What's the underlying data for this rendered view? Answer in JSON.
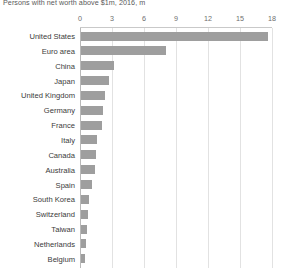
{
  "chart": {
    "subtitle": "Persons with net worth above $1m, 2016, m"
  },
  "chart_data": {
    "type": "bar",
    "orientation": "horizontal",
    "title": "",
    "subtitle": "Persons with net worth above $1m, 2016, m",
    "xlabel": "",
    "ylabel": "",
    "xlim": [
      0,
      18
    ],
    "ticks": [
      "0",
      "3",
      "6",
      "9",
      "12",
      "15",
      "18"
    ],
    "tick_values": [
      0,
      3,
      6,
      9,
      12,
      15,
      18
    ],
    "grid": true,
    "legend": false,
    "axis_position": "top",
    "bar_color": "#9e9e9e",
    "grid_color": "#e2e2e2",
    "categories": [
      "United States",
      "Euro area",
      "China",
      "Japan",
      "United Kingdom",
      "Germany",
      "France",
      "Italy",
      "Canada",
      "Australia",
      "Spain",
      "South Korea",
      "Switzerland",
      "Taiwan",
      "Netherlands",
      "Belgium"
    ],
    "values": [
      17.5,
      8.0,
      3.1,
      2.6,
      2.25,
      2.05,
      1.95,
      1.5,
      1.4,
      1.35,
      1.0,
      0.75,
      0.7,
      0.55,
      0.48,
      0.4
    ]
  }
}
